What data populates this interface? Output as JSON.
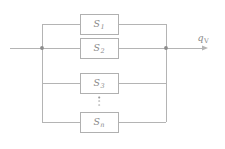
{
  "diagram": {
    "colors": {
      "line": "#b4b4b4",
      "box_border": "#b0b0b0",
      "box_fill": "#ffffff",
      "text": "#8a8a8a",
      "node": "#8c8c8c",
      "background": "#ffffff"
    },
    "blocks": [
      {
        "symbol": "S",
        "subscript": "1",
        "label": "S1",
        "cx": 99,
        "cy": 24
      },
      {
        "symbol": "S",
        "subscript": "2",
        "label": "S2",
        "cx": 99,
        "cy": 48
      },
      {
        "symbol": "S",
        "subscript": "3",
        "label": "S3",
        "cx": 99,
        "cy": 83
      },
      {
        "symbol": "S",
        "subscript": "n",
        "label": "Sn",
        "cx": 99,
        "cy": 122
      }
    ],
    "ellipsis": {
      "name": "vertical-ellipsis",
      "dots": 3,
      "cx": 99,
      "cy": 101
    },
    "output": {
      "symbol": "q",
      "subscript": "V",
      "label": "qV",
      "cx": 203,
      "cy": 38
    },
    "nodes": [
      {
        "name": "input-junction",
        "cx": 42,
        "cy": 48
      },
      {
        "name": "output-junction",
        "cx": 166,
        "cy": 48
      }
    ],
    "geometry": {
      "box_left": 80,
      "box_right": 118,
      "box_height": 20,
      "left_bus_x": 42,
      "right_bus_x": 166,
      "input_line_start_x": 10,
      "output_arrow_end_x": 208,
      "rows_y": [
        24,
        48,
        83,
        122
      ]
    }
  }
}
